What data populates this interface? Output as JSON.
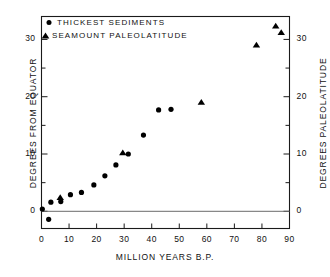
{
  "chart_data": {
    "type": "scatter",
    "title": "",
    "xlabel": "MILLION YEARS B.P.",
    "ylabel": "DEGREES FROM EQUATOR",
    "ylabel_right": "DEGREES PALEOLATITUDE",
    "xlim": [
      0,
      90
    ],
    "ylim": [
      -3,
      34
    ],
    "xticks": [
      0,
      10,
      20,
      30,
      40,
      50,
      60,
      70,
      80,
      90
    ],
    "xticklabels": [
      "0",
      "10",
      "20",
      "30",
      "40",
      "50",
      "60",
      "70",
      "80",
      "90"
    ],
    "yticks": [
      0,
      10,
      20,
      30
    ],
    "yticklabels": [
      "0",
      "10",
      "20",
      "30"
    ],
    "yticks_minor": [
      5,
      15,
      25
    ],
    "yticks_right": [
      0,
      10,
      20,
      30
    ],
    "yticklabels_right": [
      "0",
      "10",
      "20",
      "30"
    ],
    "grid": false,
    "zero_line": true,
    "legend_position": "upper left",
    "series": [
      {
        "name": "THICKEST SEDIMENTS",
        "marker": "circle",
        "color": "#000000",
        "points": [
          {
            "x": 0.3,
            "y": 0.4
          },
          {
            "x": 2.6,
            "y": -1.4
          },
          {
            "x": 3.4,
            "y": 1.6
          },
          {
            "x": 7.0,
            "y": 1.7
          },
          {
            "x": 10.5,
            "y": 2.9
          },
          {
            "x": 14.5,
            "y": 3.3
          },
          {
            "x": 19.0,
            "y": 4.6
          },
          {
            "x": 23.0,
            "y": 6.2
          },
          {
            "x": 27.0,
            "y": 8.1
          },
          {
            "x": 31.5,
            "y": 10.0
          },
          {
            "x": 37.0,
            "y": 13.3
          },
          {
            "x": 42.5,
            "y": 17.7
          },
          {
            "x": 47.0,
            "y": 17.8
          }
        ]
      },
      {
        "name": "SEAMOUNT PALEOLATITUDE",
        "marker": "triangle",
        "color": "#000000",
        "points": [
          {
            "x": 6.8,
            "y": 2.4
          },
          {
            "x": 29.5,
            "y": 10.2
          },
          {
            "x": 58.0,
            "y": 19.0
          },
          {
            "x": 78.0,
            "y": 29.0
          },
          {
            "x": 85.0,
            "y": 32.3
          },
          {
            "x": 87.0,
            "y": 31.2
          }
        ]
      }
    ]
  },
  "legend": {
    "items": [
      {
        "label": "THICKEST SEDIMENTS",
        "marker": "circle"
      },
      {
        "label": "SEAMOUNT PALEOLATITUDE",
        "marker": "triangle"
      }
    ]
  }
}
